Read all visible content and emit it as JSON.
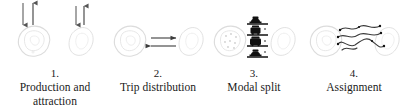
{
  "figure": {
    "background_color": "#ffffff",
    "text_color": "#1a1a1a",
    "zone_outline_color": "#d9d9d9",
    "zone_dot_color": "#c9c9c9",
    "arrow_color": "#555555",
    "icon_color": "#111111",
    "route_color": "#3a3a3a"
  },
  "steps": [
    {
      "number": "1.",
      "label": "Production and attraction",
      "label_line_1": "Production and",
      "label_line_2": "attraction",
      "icon_name": "production-attraction-arrows",
      "arrows": [
        {
          "name": "production-arrow-down",
          "direction": "down"
        },
        {
          "name": "attraction-arrow-up",
          "direction": "up"
        },
        {
          "name": "production-arrow-down-2",
          "direction": "down"
        },
        {
          "name": "attraction-arrow-up-2",
          "direction": "up"
        }
      ],
      "zones": 2
    },
    {
      "number": "2.",
      "label": "Trip distribution",
      "label_line_1": "Trip distribution",
      "label_line_2": "",
      "icon_name": "trip-distribution-arrows",
      "arrows": [
        {
          "name": "flow-arrow-right",
          "direction": "right"
        },
        {
          "name": "flow-arrow-left",
          "direction": "left"
        }
      ],
      "zones": 2
    },
    {
      "number": "3.",
      "label": "Modal split",
      "label_line_1": "Modal split",
      "label_line_2": "",
      "icon_name": "modal-split-vehicle-stack",
      "modes": [
        {
          "name": "mode-car",
          "label": "car"
        },
        {
          "name": "mode-bus",
          "label": "bus"
        },
        {
          "name": "mode-train",
          "label": "train"
        }
      ],
      "zones": 2
    },
    {
      "number": "4.",
      "label": "Assignment",
      "label_line_1": "Assignment",
      "label_line_2": "",
      "icon_name": "assignment-network-routes",
      "routes": 3,
      "zones": 2
    }
  ]
}
